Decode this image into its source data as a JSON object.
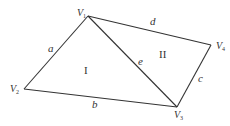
{
  "diagram": {
    "type": "graph",
    "vertices": [
      {
        "id": "V1",
        "letter": "V",
        "sub": "1",
        "x": 88,
        "y": 16
      },
      {
        "id": "V2",
        "letter": "V",
        "sub": "2",
        "x": 24,
        "y": 89
      },
      {
        "id": "V3",
        "letter": "V",
        "sub": "3",
        "x": 177,
        "y": 107
      },
      {
        "id": "V4",
        "letter": "V",
        "sub": "4",
        "x": 211,
        "y": 45
      }
    ],
    "edges": [
      {
        "label": "a",
        "from": "V1",
        "to": "V2"
      },
      {
        "label": "b",
        "from": "V2",
        "to": "V3"
      },
      {
        "label": "c",
        "from": "V3",
        "to": "V4"
      },
      {
        "label": "d",
        "from": "V1",
        "to": "V4"
      },
      {
        "label": "e",
        "from": "V1",
        "to": "V3"
      }
    ],
    "regions": [
      {
        "label": "I"
      },
      {
        "label": "II"
      }
    ],
    "stroke_color": "#333333"
  }
}
